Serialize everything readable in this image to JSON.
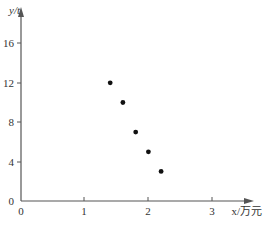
{
  "chart_data": {
    "type": "scatter",
    "title": "",
    "xlabel": "x/万元",
    "ylabel": "y/t",
    "x_ticks": [
      0,
      1,
      2,
      3
    ],
    "y_ticks": [
      0,
      4,
      8,
      12,
      16
    ],
    "xlim": [
      0,
      3.5
    ],
    "ylim": [
      0,
      18
    ],
    "grid": false,
    "legend": null,
    "series": [
      {
        "name": "data",
        "x": [
          1.4,
          1.6,
          1.8,
          2.0,
          2.2
        ],
        "y": [
          12,
          10,
          7,
          5,
          3
        ]
      }
    ]
  },
  "labels": {
    "x_axis": "x/万元",
    "y_axis": "y/t",
    "origin": "0",
    "x_tick_1": "1",
    "x_tick_2": "2",
    "x_tick_3": "3",
    "y_tick_4": "4",
    "y_tick_8": "8",
    "y_tick_12": "12",
    "y_tick_16": "16",
    "y_tick_0": "0"
  }
}
